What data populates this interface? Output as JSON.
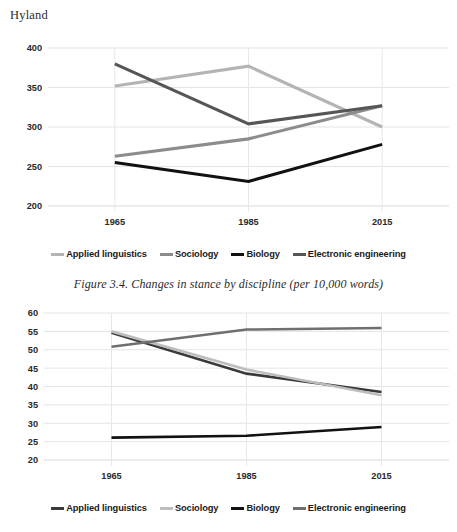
{
  "page": {
    "header": "Hyland"
  },
  "caption": {
    "text": "Figure 3.4. Changes in stance by discipline (per 10,000 words)"
  },
  "colors": {
    "applied_linguistics_top": "#b4b4b4",
    "sociology_top": "#8c8c8c",
    "biology_top": "#111111",
    "electronic_engineering_top": "#565656",
    "applied_linguistics_bottom": "#3a3a3a",
    "sociology_bottom": "#bdbdbd",
    "biology_bottom": "#111111",
    "electronic_engineering_bottom": "#6f6f6f",
    "gridline": "#e4e4e4",
    "text": "#231f20"
  },
  "legend_top": {
    "items": [
      {
        "label": "Applied linguistics",
        "color": "#b4b4b4"
      },
      {
        "label": "Sociology",
        "color": "#8c8c8c"
      },
      {
        "label": "Biology",
        "color": "#111111"
      },
      {
        "label": "Electronic engineering",
        "color": "#565656"
      }
    ]
  },
  "legend_bottom": {
    "items": [
      {
        "label": "Applied linguistics",
        "color": "#3a3a3a"
      },
      {
        "label": "Sociology",
        "color": "#bdbdbd"
      },
      {
        "label": "Biology",
        "color": "#111111"
      },
      {
        "label": "Electronic engineering",
        "color": "#6f6f6f"
      }
    ]
  },
  "chart_data": [
    {
      "type": "line",
      "title": "",
      "xlabel": "",
      "ylabel": "",
      "categories": [
        "1965",
        "1985",
        "2015"
      ],
      "x": [
        1965,
        1985,
        2015
      ],
      "ylim": [
        200,
        400
      ],
      "yticks": [
        200,
        250,
        300,
        350,
        400
      ],
      "ytick_labels": [
        "200",
        "250",
        "300",
        "350",
        "400"
      ],
      "grid": true,
      "legend_position": "bottom",
      "series": [
        {
          "name": "Applied linguistics",
          "color": "#b4b4b4",
          "values": [
            352,
            377,
            300
          ]
        },
        {
          "name": "Sociology",
          "color": "#8c8c8c",
          "values": [
            263,
            285,
            327
          ]
        },
        {
          "name": "Biology",
          "color": "#111111",
          "values": [
            255,
            231,
            278
          ]
        },
        {
          "name": "Electronic engineering",
          "color": "#565656",
          "values": [
            380,
            304,
            327
          ]
        }
      ]
    },
    {
      "type": "line",
      "title": "",
      "xlabel": "",
      "ylabel": "",
      "categories": [
        "1965",
        "1985",
        "2015"
      ],
      "x": [
        1965,
        1985,
        2015
      ],
      "ylim": [
        20,
        60
      ],
      "yticks": [
        20,
        25,
        30,
        35,
        40,
        45,
        50,
        55,
        60
      ],
      "ytick_labels": [
        "20",
        "25",
        "30",
        "35",
        "40",
        "45",
        "50",
        "55",
        "60"
      ],
      "grid": true,
      "legend_position": "bottom",
      "series": [
        {
          "name": "Applied linguistics",
          "color": "#3a3a3a",
          "values": [
            54.6,
            43.5,
            38.5
          ]
        },
        {
          "name": "Sociology",
          "color": "#bdbdbd",
          "values": [
            55.0,
            44.6,
            37.6
          ]
        },
        {
          "name": "Biology",
          "color": "#111111",
          "values": [
            26.1,
            26.6,
            29.0
          ]
        },
        {
          "name": "Electronic engineering",
          "color": "#6f6f6f",
          "values": [
            50.8,
            55.5,
            55.9
          ]
        }
      ]
    }
  ]
}
